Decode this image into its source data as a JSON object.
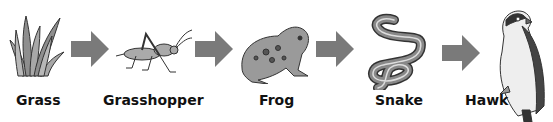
{
  "diagram": {
    "type": "food_chain",
    "organisms": [
      {
        "name": "Grass",
        "icon": "grass-icon"
      },
      {
        "name": "Grasshopper",
        "icon": "grasshopper-icon"
      },
      {
        "name": "Frog",
        "icon": "frog-icon"
      },
      {
        "name": "Snake",
        "icon": "snake-icon"
      },
      {
        "name": "Hawk",
        "icon": "hawk-icon"
      }
    ],
    "arrow_color": "#7a7a7a",
    "organism_fill": "#9a9a9a",
    "outline_color": "#333333"
  }
}
